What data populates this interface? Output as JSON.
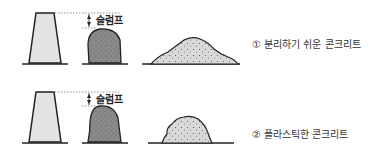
{
  "diagram": {
    "rows": [
      {
        "slump_label": "슬럼프",
        "caption": "① 분리하기 쉬운 콘크리트"
      },
      {
        "slump_label": "슬럼프",
        "caption": "② 플라스틱한 콘크리트"
      }
    ]
  }
}
